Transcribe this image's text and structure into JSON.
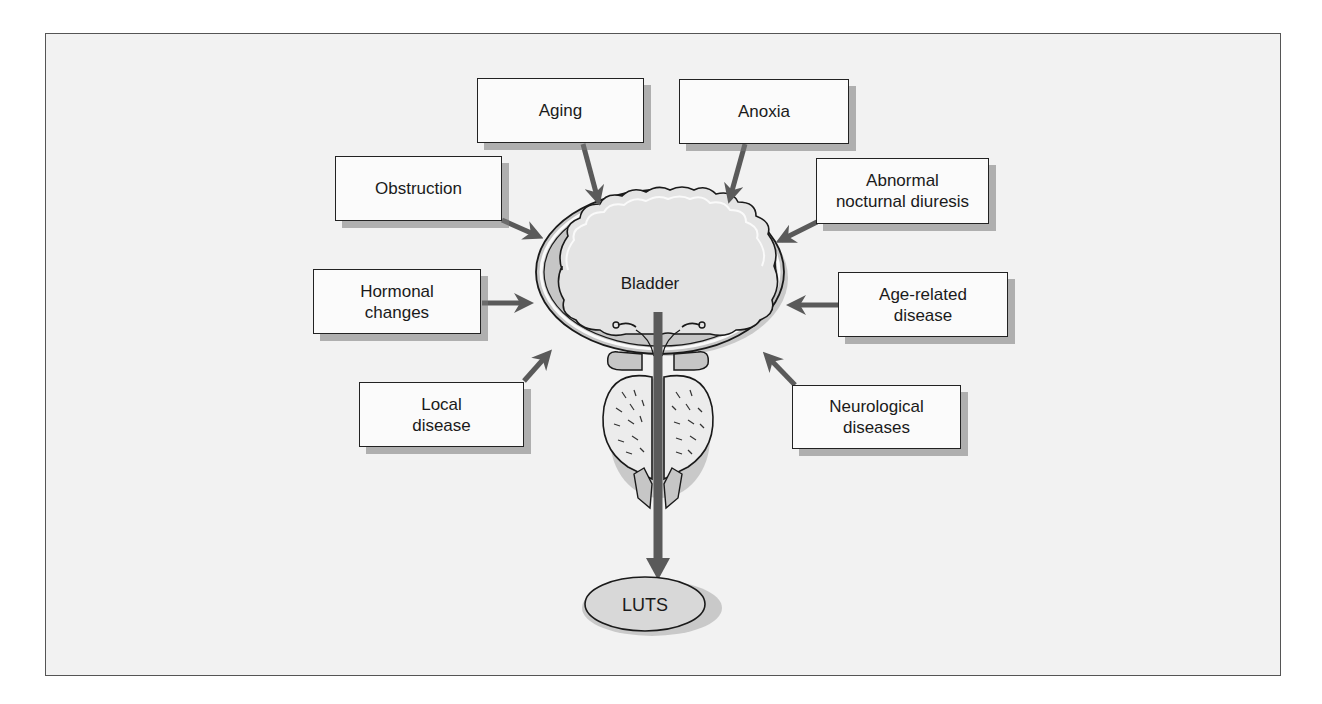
{
  "diagram": {
    "center": {
      "organ_label": "Bladder",
      "outcome_label": "LUTS"
    },
    "factors": [
      {
        "id": "aging",
        "label": "Aging"
      },
      {
        "id": "anoxia",
        "label": "Anoxia"
      },
      {
        "id": "obstruction",
        "label": "Obstruction"
      },
      {
        "id": "abnormal-nocturnal-diuresis",
        "label": "Abnormal\nnocturnal diuresis"
      },
      {
        "id": "hormonal-changes",
        "label": "Hormonal\nchanges"
      },
      {
        "id": "age-related-disease",
        "label": "Age-related\ndisease"
      },
      {
        "id": "local-disease",
        "label": "Local\ndisease"
      },
      {
        "id": "neurological-diseases",
        "label": "Neurological\ndiseases"
      }
    ],
    "colors": {
      "background": "#f2f2f2",
      "box_fill": "#fbfbfb",
      "arrow": "#5a5a5a",
      "bladder_wall": "#c6c6c6",
      "bladder_lumen": "#e4e4e4",
      "outline": "#1a1a1a"
    }
  }
}
